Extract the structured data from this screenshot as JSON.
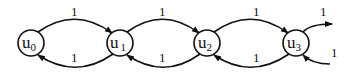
{
  "diagram": {
    "type": "state-transition-graph",
    "nodes": [
      {
        "id": "u0",
        "base": "u",
        "sub": "0",
        "cx": 31,
        "cy": 43
      },
      {
        "id": "u1",
        "base": "u",
        "sub": "1",
        "cx": 120,
        "cy": 43
      },
      {
        "id": "u2",
        "base": "u",
        "sub": "2",
        "cx": 207,
        "cy": 43
      },
      {
        "id": "u3",
        "base": "u",
        "sub": "3",
        "cx": 296,
        "cy": 43
      }
    ],
    "edges": [
      {
        "from": "u0",
        "to": "u1",
        "label": "1",
        "direction": "forward"
      },
      {
        "from": "u1",
        "to": "u0",
        "label": "1",
        "direction": "backward"
      },
      {
        "from": "u1",
        "to": "u2",
        "label": "1",
        "direction": "forward"
      },
      {
        "from": "u2",
        "to": "u1",
        "label": "1",
        "direction": "backward"
      },
      {
        "from": "u2",
        "to": "u3",
        "label": "1",
        "direction": "forward"
      },
      {
        "from": "u3",
        "to": "u2",
        "label": "1",
        "direction": "backward"
      },
      {
        "from": "u3",
        "to": "…",
        "label": "1",
        "direction": "forward-outgoing"
      },
      {
        "from": "…",
        "to": "u3",
        "label": "1",
        "direction": "backward-incoming"
      }
    ]
  }
}
